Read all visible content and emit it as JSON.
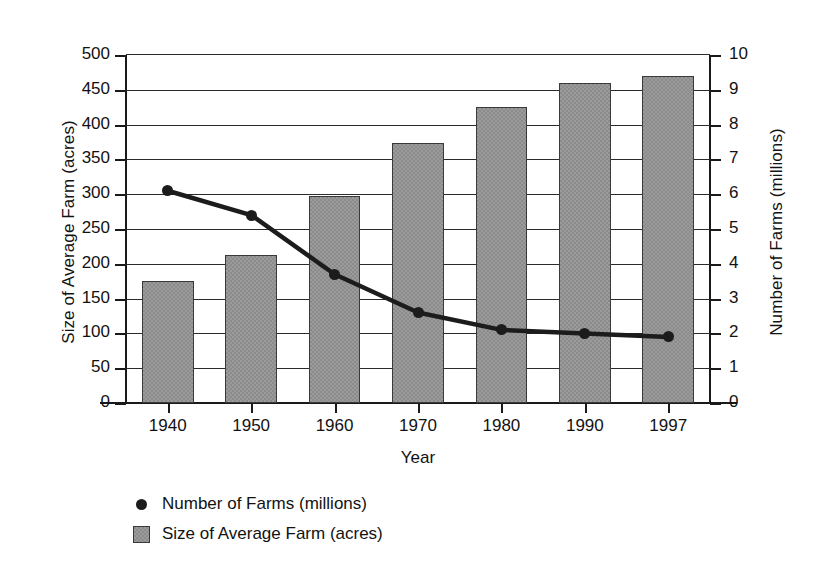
{
  "chart_data": {
    "type": "bar",
    "title": "",
    "subtitle": "",
    "xlabel": "Year",
    "ylabel": "Size of Average Farm (acres)",
    "y2label": "Number of Farms (millions)",
    "categories": [
      "1940",
      "1950",
      "1960",
      "1970",
      "1980",
      "1990",
      "1997"
    ],
    "ylim": [
      0,
      500
    ],
    "y2lim": [
      0,
      10
    ],
    "yticks": [
      0,
      50,
      100,
      150,
      200,
      250,
      300,
      350,
      400,
      450,
      500
    ],
    "y2ticks": [
      0,
      1,
      2,
      3,
      4,
      5,
      6,
      7,
      8,
      9,
      10
    ],
    "ytick_labels": [
      "0",
      "50",
      "100",
      "150",
      "200",
      "250",
      "300",
      "350",
      "400",
      "450",
      "500"
    ],
    "y2tick_labels": [
      "0",
      "1",
      "2",
      "3",
      "4",
      "5",
      "6",
      "7",
      "8",
      "9",
      "10"
    ],
    "grid": true,
    "grid_axis": "y",
    "legend_position": "bottom-left",
    "series": [
      {
        "name": "Number of Farms (millions)",
        "type": "line",
        "axis": "right",
        "marker": "circle",
        "color": "#1c1c1c",
        "values": [
          6.1,
          5.4,
          3.7,
          2.6,
          2.1,
          2.0,
          1.9
        ]
      },
      {
        "name": "Size of Average Farm (acres)",
        "type": "bar",
        "axis": "left",
        "color": "#8b8b8b",
        "values": [
          175,
          212,
          297,
          374,
          425,
          460,
          470
        ]
      }
    ],
    "legend": [
      {
        "label": "Number of Farms (millions)",
        "marker": "dot"
      },
      {
        "label": "Size of Average Farm (acres)",
        "marker": "square"
      }
    ]
  },
  "colors": {
    "bar_fill": "#8b8b8b",
    "bar_border": "#3a3a3a",
    "line": "#1c1c1c",
    "axis": "#1a1a1a",
    "grid": "#2b2b2b",
    "background": "#ffffff"
  }
}
